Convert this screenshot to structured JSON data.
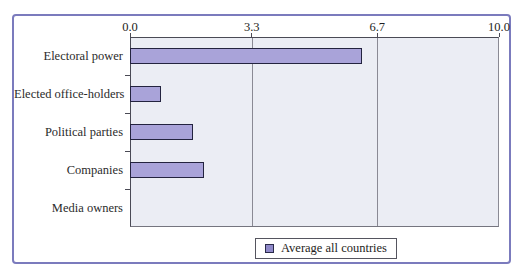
{
  "chart_data": {
    "type": "bar",
    "orientation": "horizontal",
    "title": "",
    "categories": [
      "Electoral power",
      "Elected office-holders",
      "Political parties",
      "Companies",
      "Media owners"
    ],
    "series": [
      {
        "name": "Average all countries",
        "values": [
          6.3,
          0.85,
          1.7,
          2.0,
          0
        ]
      }
    ],
    "xlim": [
      0,
      10
    ],
    "xticks": [
      0,
      3.3,
      6.7,
      10
    ],
    "xtick_labels": [
      "0.0",
      "3.3",
      "6.7",
      "10.0"
    ],
    "x_axis_position": "top",
    "grid": "vertical gridlines at interior x ticks",
    "legend_position": "bottom-center",
    "colors": {
      "bar_fill": "#a9a3d9",
      "bar_border": "#23233f",
      "plot_background": "#ebedf4",
      "gridline": "#8a8a94",
      "axis": "#4a4a55",
      "frame_border": "#7b7bbd",
      "text": "#2b2b2b"
    }
  },
  "legend": {
    "label": "Average all countries"
  }
}
